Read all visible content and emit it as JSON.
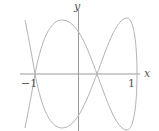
{
  "figure": {
    "type": "parametric-curve-plot",
    "axes": {
      "x_label": "x",
      "y_label": "y",
      "ticks": [
        {
          "label": "−1",
          "value": -1
        },
        {
          "label": "1",
          "value": 1
        }
      ]
    },
    "colors": {
      "axis": "#999999",
      "curve": "#b0b0b0",
      "text": "#555555"
    }
  }
}
